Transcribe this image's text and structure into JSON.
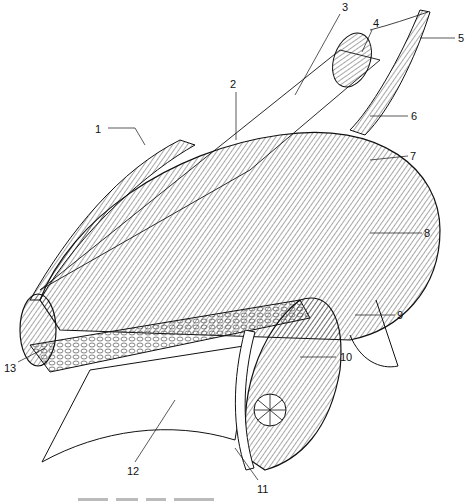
{
  "figure": {
    "type": "anatomical line drawing",
    "labels": [
      {
        "n": "1",
        "x": 95,
        "y": 124
      },
      {
        "n": "2",
        "x": 230,
        "y": 79
      },
      {
        "n": "3",
        "x": 342,
        "y": 2
      },
      {
        "n": "4",
        "x": 373,
        "y": 18
      },
      {
        "n": "5",
        "x": 458,
        "y": 33
      },
      {
        "n": "6",
        "x": 411,
        "y": 111
      },
      {
        "n": "7",
        "x": 410,
        "y": 151
      },
      {
        "n": "8",
        "x": 424,
        "y": 228
      },
      {
        "n": "9",
        "x": 397,
        "y": 310
      },
      {
        "n": "10",
        "x": 340,
        "y": 352
      },
      {
        "n": "11",
        "x": 257,
        "y": 484
      },
      {
        "n": "12",
        "x": 127,
        "y": 466
      },
      {
        "n": "13",
        "x": 4,
        "y": 363
      }
    ],
    "caption_visible": false
  }
}
